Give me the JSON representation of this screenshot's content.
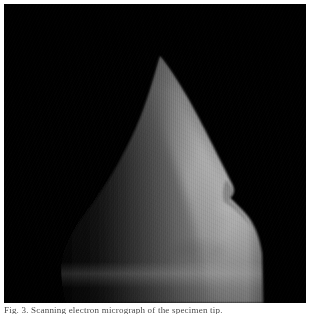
{
  "page": {
    "background_color": "#ffffff",
    "width": 310,
    "height": 314
  },
  "figure": {
    "name": "micrograph-plate",
    "background_color": "#000000",
    "frame": {
      "x": 4,
      "y": 4,
      "width": 302,
      "height": 299
    },
    "modality": "grayscale electron micrograph",
    "tones": {
      "background": "#000000",
      "shadow_side": "#262626",
      "midtone": "#6e6e6e",
      "highlight": "#c9c9c9",
      "peak_highlight": "#dedede"
    },
    "features": [
      {
        "name": "apex",
        "description": "sharp pointed tip, upper centre-left"
      },
      {
        "name": "left-flank",
        "description": "dark shadowed flank falling to lower left"
      },
      {
        "name": "right-flank",
        "description": "brightly lit flank with a distinct notch or step"
      },
      {
        "name": "right-notch",
        "description": "step in the right outline at mid height"
      },
      {
        "name": "basal-band",
        "description": "pale transverse band near the lower edge"
      },
      {
        "name": "scan-striations",
        "description": "fine vertical scan lines across the surface"
      }
    ]
  },
  "caption": {
    "text": "Fig. 3. Scanning electron micrograph of the specimen tip.",
    "clipped": true
  }
}
